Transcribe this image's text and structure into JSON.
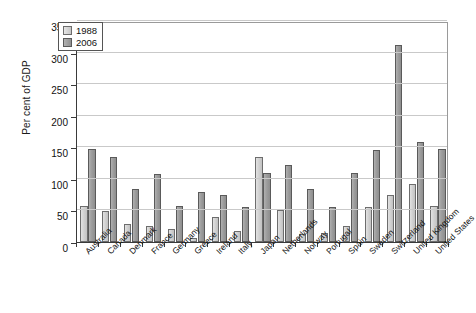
{
  "chart_data": {
    "type": "bar",
    "title": "",
    "subtitle": "",
    "xlabel": "",
    "ylabel": "Per cent of GDP",
    "ylim": [
      0,
      350
    ],
    "ytick_step": 50,
    "yticks": [
      "0",
      "50",
      "100",
      "150",
      "200",
      "250",
      "300",
      "350"
    ],
    "grid": true,
    "legend_position": "top-left",
    "categories": [
      "Australia",
      "Canada",
      "Denmark",
      "France",
      "Germany",
      "Greece",
      "Ireland",
      "Italy",
      "Japan",
      "Netherlands",
      "Norway",
      "Portugal",
      "Spain",
      "Sweden",
      "Switzerland",
      "United Kingdom",
      "United States"
    ],
    "series": [
      {
        "name": "1988",
        "color": "#d2d2d2",
        "values": [
          57,
          49,
          28,
          26,
          20,
          7,
          40,
          18,
          135,
          50,
          13,
          15,
          25,
          55,
          74,
          92,
          57
        ]
      },
      {
        "name": "2006",
        "color": "#9d9d9d",
        "values": [
          147,
          134,
          84,
          107,
          57,
          79,
          74,
          56,
          110,
          122,
          84,
          55,
          109,
          146,
          312,
          159,
          147
        ]
      }
    ]
  },
  "legend": {
    "items": [
      {
        "label": "1988"
      },
      {
        "label": "2006"
      }
    ]
  }
}
